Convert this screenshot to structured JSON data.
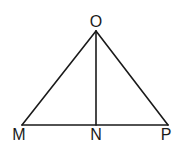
{
  "figure": {
    "stroke_color": "#1a1a1a",
    "background": "#ffffff",
    "points": {
      "O": {
        "label": "O",
        "x": 96,
        "y": 31
      },
      "M": {
        "label": "M",
        "x": 22,
        "y": 125
      },
      "N": {
        "label": "N",
        "x": 96,
        "y": 125
      },
      "P": {
        "label": "P",
        "x": 168,
        "y": 125
      }
    },
    "segments": [
      "OM",
      "OP",
      "MP",
      "ON"
    ]
  }
}
